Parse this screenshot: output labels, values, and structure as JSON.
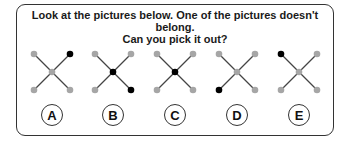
{
  "question": {
    "line1": "Look at the pictures below. One of the pictures doesn't belong.",
    "line2": "Can you pick it out?"
  },
  "colors": {
    "dot_gray": "#a6a6a6",
    "dot_black": "#000000",
    "line": "#444444",
    "border": "#333333"
  },
  "options": [
    {
      "label": "A",
      "black_dots": [
        "top-right"
      ],
      "center_x": 52
    },
    {
      "label": "B",
      "black_dots": [
        "center",
        "bottom-right"
      ],
      "center_x": 113
    },
    {
      "label": "C",
      "black_dots": [
        "center"
      ],
      "center_x": 175
    },
    {
      "label": "D",
      "black_dots": [
        "bottom-left"
      ],
      "center_x": 237
    },
    {
      "label": "E",
      "black_dots": [
        "top-left"
      ],
      "center_x": 299
    }
  ]
}
